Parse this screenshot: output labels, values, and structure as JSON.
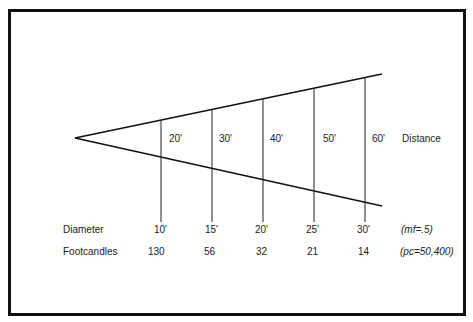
{
  "diagram": {
    "title": "",
    "apex": {
      "x": 75,
      "y": 138
    },
    "top_line_end": {
      "x": 382,
      "y": 74
    },
    "bottom_line_end": {
      "x": 382,
      "y": 206
    },
    "row_labels": {
      "distance": "Distance",
      "diameter": "Diameter",
      "footcandles": "Footcandles"
    },
    "notes": {
      "mf": "(mf=.5)",
      "pc": "(pc=50,400)"
    },
    "stations": [
      {
        "x": 160,
        "distance": "20'",
        "diameter": "10'",
        "footcandles": "130"
      },
      {
        "x": 211,
        "distance": "30'",
        "diameter": "15'",
        "footcandles": "56"
      },
      {
        "x": 262,
        "distance": "40'",
        "diameter": "20'",
        "footcandles": "32"
      },
      {
        "x": 313,
        "distance": "50'",
        "diameter": "25'",
        "footcandles": "21"
      },
      {
        "x": 364,
        "distance": "60'",
        "diameter": "30'",
        "footcandles": "14"
      }
    ],
    "line_color": "#111111"
  }
}
